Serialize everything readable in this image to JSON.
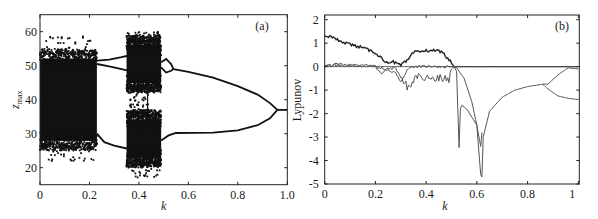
{
  "figure": {
    "panels": [
      "(a)",
      "(b)"
    ]
  },
  "chart_data": [
    {
      "type": "scatter",
      "panel_label": "(a)",
      "title": "",
      "xlabel": "k",
      "ylabel": "z_max",
      "ylabel_main": "z",
      "ylabel_sub": "max",
      "xlim": [
        0,
        1.0
      ],
      "ylim": [
        15,
        65
      ],
      "xticks": [
        0,
        0.2,
        0.4,
        0.6,
        0.8,
        1.0
      ],
      "xtick_labels": [
        "0",
        "0.2",
        "0.4",
        "0.6",
        "0.8",
        "1.0"
      ],
      "yticks": [
        20,
        30,
        40,
        50,
        60
      ],
      "ytick_labels": [
        "20",
        "30",
        "40",
        "50",
        "60"
      ],
      "grid": false,
      "description": "Bifurcation diagram of z_max versus k",
      "chaotic_bands": [
        {
          "k_range": [
            0.0,
            0.23
          ],
          "z_range": [
            27,
            53
          ],
          "outliers_z": [
            22,
            59
          ]
        },
        {
          "k_range": [
            0.35,
            0.49
          ],
          "z_range": [
            44,
            57
          ],
          "outliers_z": [
            43,
            60
          ]
        },
        {
          "k_range": [
            0.35,
            0.49
          ],
          "z_range": [
            22,
            35
          ],
          "outliers_z": [
            17,
            37
          ]
        }
      ],
      "periodic_branches": [
        {
          "name": "upper-outer",
          "points": [
            [
              0.23,
              51.5
            ],
            [
              0.28,
              51.8
            ],
            [
              0.33,
              52.5
            ],
            [
              0.36,
              53
            ]
          ]
        },
        {
          "name": "upper-inner",
          "points": [
            [
              0.23,
              50.5
            ],
            [
              0.28,
              49.8
            ],
            [
              0.33,
              49.0
            ],
            [
              0.36,
              48.5
            ]
          ]
        },
        {
          "name": "lower",
          "points": [
            [
              0.23,
              30
            ],
            [
              0.26,
              27.5
            ],
            [
              0.3,
              26.5
            ],
            [
              0.36,
              25.5
            ]
          ]
        },
        {
          "name": "upper-p2-a",
          "points": [
            [
              0.49,
              51
            ],
            [
              0.51,
              52
            ],
            [
              0.53,
              50.5
            ],
            [
              0.54,
              49
            ]
          ]
        },
        {
          "name": "upper-p2-b",
          "points": [
            [
              0.49,
              49.5
            ],
            [
              0.51,
              48
            ],
            [
              0.53,
              48.5
            ],
            [
              0.54,
              49
            ]
          ]
        },
        {
          "name": "upper-main",
          "points": [
            [
              0.54,
              49
            ],
            [
              0.6,
              48.2
            ],
            [
              0.7,
              46.5
            ],
            [
              0.8,
              44
            ],
            [
              0.88,
              41.5
            ],
            [
              0.93,
              39
            ],
            [
              0.96,
              37
            ]
          ]
        },
        {
          "name": "lower-main",
          "points": [
            [
              0.49,
              28
            ],
            [
              0.52,
              29.5
            ],
            [
              0.55,
              30.2
            ],
            [
              0.7,
              30.3
            ],
            [
              0.8,
              31
            ],
            [
              0.88,
              32.5
            ],
            [
              0.93,
              34.5
            ],
            [
              0.96,
              37
            ]
          ]
        },
        {
          "name": "fixed-point",
          "points": [
            [
              0.96,
              37
            ],
            [
              1.0,
              37
            ]
          ]
        }
      ]
    },
    {
      "type": "line",
      "panel_label": "(b)",
      "title": "",
      "xlabel": "k",
      "ylabel": "Lypunov",
      "xlim": [
        0,
        1.0
      ],
      "ylim": [
        -5,
        2.2
      ],
      "xticks": [
        0,
        0.2,
        0.4,
        0.6,
        0.8,
        1
      ],
      "xtick_labels": [
        "0",
        "0.2",
        "0.4",
        "0.6",
        "0.8",
        "1"
      ],
      "yticks": [
        2,
        1,
        0,
        -1,
        -2,
        -3,
        -4,
        -5
      ],
      "ytick_labels": [
        "2",
        "1",
        "0",
        "-1",
        "-2",
        "-3",
        "-4",
        "-5"
      ],
      "grid": false,
      "series": [
        {
          "name": "lambda1",
          "x": [
            0,
            0.05,
            0.1,
            0.15,
            0.2,
            0.24,
            0.27,
            0.3,
            0.33,
            0.35,
            0.38,
            0.42,
            0.46,
            0.49,
            0.51,
            0.53,
            0.6,
            0.7,
            0.8,
            0.9,
            1.0
          ],
          "y": [
            1.35,
            1.15,
            0.95,
            0.8,
            0.6,
            0.2,
            0.2,
            0.05,
            0.3,
            0.6,
            0.65,
            0.7,
            0.65,
            0.3,
            0.0,
            0.0,
            0.0,
            0.0,
            0.0,
            0.0,
            0.0
          ]
        },
        {
          "name": "lambda2",
          "x": [
            0,
            0.05,
            0.1,
            0.15,
            0.2,
            0.22,
            0.25,
            0.28,
            0.3,
            0.33,
            0.36,
            0.4,
            0.45,
            0.49,
            0.5,
            0.51,
            0.52,
            0.53,
            0.535,
            0.54,
            0.56,
            0.6,
            0.615,
            0.62,
            0.625,
            0.65,
            0.7,
            0.75,
            0.8,
            0.86,
            0.88,
            0.92,
            0.96,
            1.0
          ],
          "y": [
            0.0,
            0.1,
            0.05,
            0.1,
            0.0,
            -0.3,
            -0.1,
            -0.05,
            -0.5,
            -0.9,
            -0.4,
            -0.5,
            -0.5,
            -0.55,
            -0.1,
            0.0,
            -0.2,
            -3.45,
            -1.8,
            -1.65,
            -1.8,
            -2.5,
            -4.6,
            -4.7,
            -3.0,
            -1.9,
            -1.3,
            -1.0,
            -0.85,
            -0.75,
            -0.75,
            -0.35,
            -0.05,
            -0.1
          ]
        },
        {
          "name": "lambda3",
          "x": [
            0,
            0.1,
            0.2,
            0.25,
            0.28,
            0.3,
            0.33,
            0.35,
            0.5,
            0.52,
            0.55,
            0.58,
            0.6,
            0.615,
            0.62
          ],
          "y": [
            0.05,
            0.05,
            0.0,
            -0.1,
            -0.3,
            -0.6,
            -0.1,
            0.0,
            0.0,
            -0.05,
            -0.5,
            -1.5,
            -2.5,
            -3.4,
            -2.8
          ]
        },
        {
          "name": "lambda-branch-lower",
          "x": [
            0.86,
            0.88,
            0.92,
            0.96,
            1.0
          ],
          "y": [
            -0.75,
            -0.95,
            -1.25,
            -1.35,
            -1.4
          ]
        },
        {
          "name": "zero-line",
          "x": [
            0,
            1.0
          ],
          "y": [
            0,
            0
          ]
        }
      ]
    }
  ]
}
